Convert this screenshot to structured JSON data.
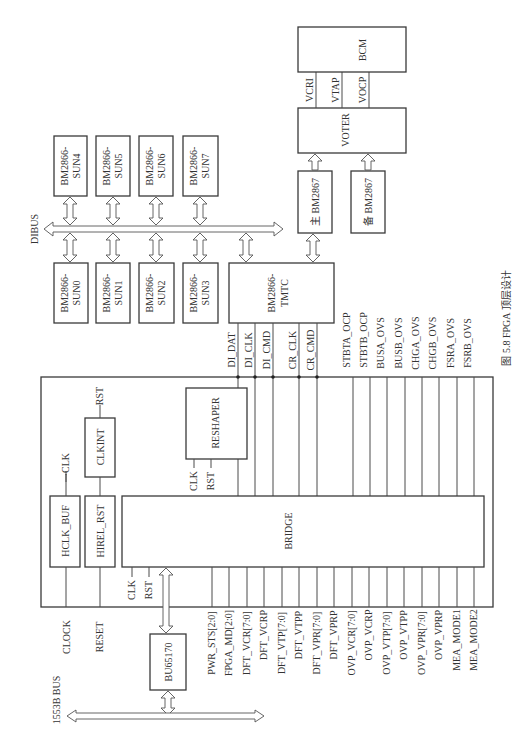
{
  "figure": {
    "caption": "图 5.8 FPGA 顶层设计",
    "orientation": "rotated 90° counter-clockwise"
  },
  "buses": {
    "dibus": "DIBUS",
    "bus1553b": "1553B BUS"
  },
  "sun_blocks": {
    "top_row": [
      {
        "line1": "BM2866-",
        "line2": "SUN4"
      },
      {
        "line1": "BM2866-",
        "line2": "SUN5"
      },
      {
        "line1": "BM2866-",
        "line2": "SUN6"
      },
      {
        "line1": "BM2866-",
        "line2": "SUN7"
      }
    ],
    "bottom_row": [
      {
        "line1": "BM2866-",
        "line2": "SUN0"
      },
      {
        "line1": "BM2866-",
        "line2": "SUN1"
      },
      {
        "line1": "BM2866-",
        "line2": "SUN2"
      },
      {
        "line1": "BM2866-",
        "line2": "SUN3"
      }
    ]
  },
  "tmtc": {
    "line1": "BM2866-",
    "line2": "TMTC"
  },
  "bm2867_main": "主 BM2867",
  "bm2867_backup": "备 BM2867",
  "voter": "VOTER",
  "bcm": "BCM",
  "voter_bcm_signals": [
    "VCRI",
    "VTAP",
    "VOCP"
  ],
  "fpga": {
    "hclk_buf": "HCLK_BUF",
    "hirel_rst": "HIREL_RST",
    "clkint": "CLKINT",
    "reshaper": "RESHAPER",
    "bridge": "BRIDGE",
    "clk": "CLK",
    "rst": "RST"
  },
  "external_inputs": {
    "clock": "CLOCK",
    "reset": "RESET"
  },
  "bu65170": "BU65170",
  "tmtc_signals": [
    "DI_DAT",
    "DI_CLK",
    "DI_CMD",
    "CR_CLK",
    "CR_CMD"
  ],
  "top_outputs": [
    "STBTA_OCP",
    "STBTB_OCP",
    "BUSA_OVS",
    "BUSB_OVS",
    "CHGA_OVS",
    "CHGB_OVS",
    "FSRA_OVS",
    "FSRB_OVS"
  ],
  "bottom_signals": [
    "PWR_STS[2:0]",
    "FPGA_MD[2:0]",
    "DFT_VCR[7:0]",
    "DFT_VCRP",
    "DFT_VTP[7:0]",
    "DFT_VTPP",
    "DFT_VPR[7:0]",
    "DFT_VPRP",
    "OVP_VCR[7:0]",
    "OVP_VCRP",
    "OVP_VTP[7:0]",
    "OVP_VTPP",
    "OVP_VPR[7:0]",
    "OVP_VPRP",
    "MEA_MODE1",
    "MEA_MODE2"
  ]
}
